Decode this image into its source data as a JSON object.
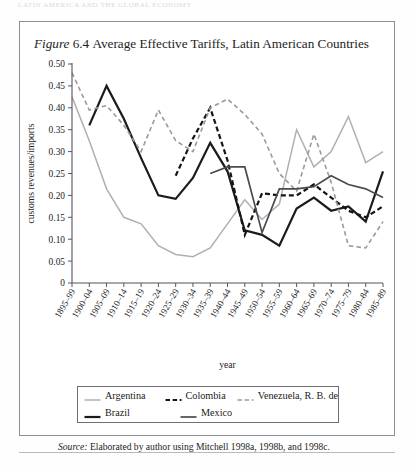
{
  "page": {
    "running_head": "LATIN AMERICA AND THE GLOBAL ECONOMY",
    "figure_title_prefix": "Figure",
    "figure_number": "6.4",
    "figure_title": "Average Effective Tariffs, Latin American Countries",
    "source_prefix": "Source:",
    "source_text": "Elaborated by author using Mitchell 1998a, 1998b, and 1998c."
  },
  "chart_data": {
    "type": "line",
    "title": "Average Effective Tariffs, Latin American Countries",
    "xlabel": "year",
    "ylabel": "customs revenues/imports",
    "ylim": [
      0,
      0.5
    ],
    "yticks": [
      "0",
      "0.05",
      "0.10",
      "0.15",
      "0.20",
      "0.25",
      "0.30",
      "0.35",
      "0.40",
      "0.45",
      "0.50"
    ],
    "ytick_values": [
      0,
      0.05,
      0.1,
      0.15,
      0.2,
      0.25,
      0.3,
      0.35,
      0.4,
      0.45,
      0.5
    ],
    "grid": false,
    "legend_position": "bottom",
    "categories": [
      "1895-99",
      "1900-04",
      "1905-09",
      "1910-14",
      "1915-19",
      "1920-24",
      "1925-29",
      "1930-34",
      "1935-39",
      "1940-44",
      "1945-49",
      "1950-54",
      "1955-59",
      "1960-64",
      "1965-69",
      "1970-74",
      "1975-79",
      "1980-84",
      "1985-89"
    ],
    "series": [
      {
        "name": "Argentina",
        "color": "#b0b0b0",
        "style": "solid",
        "width": 1.5,
        "values": [
          0.425,
          0.325,
          0.215,
          0.15,
          0.135,
          0.085,
          0.065,
          0.06,
          0.08,
          0.135,
          0.19,
          0.145,
          0.18,
          0.35,
          0.265,
          0.3,
          0.38,
          0.275,
          0.3
        ]
      },
      {
        "name": "Brazil",
        "color": "#1b1b1b",
        "style": "solid",
        "width": 2.2,
        "values": [
          null,
          0.36,
          0.45,
          0.375,
          0.285,
          0.2,
          0.192,
          0.24,
          0.32,
          0.255,
          0.12,
          0.11,
          0.085,
          0.17,
          0.195,
          0.165,
          0.175,
          0.14,
          0.255
        ]
      },
      {
        "name": "Colombia",
        "color": "#141414",
        "style": "dashed",
        "width": 2.2,
        "values": [
          null,
          null,
          null,
          null,
          null,
          null,
          0.245,
          0.33,
          0.4,
          0.28,
          0.11,
          0.205,
          0.2,
          0.2,
          0.225,
          0.195,
          0.165,
          0.15,
          0.175
        ]
      },
      {
        "name": "Venezuela, R. B. de",
        "color": "#9a9a9a",
        "style": "dashed",
        "width": 1.6,
        "values": [
          0.48,
          0.395,
          0.405,
          0.36,
          0.3,
          0.395,
          0.325,
          0.3,
          0.4,
          0.42,
          0.385,
          0.34,
          0.25,
          0.21,
          0.34,
          0.23,
          0.085,
          0.08,
          0.14
        ]
      },
      {
        "name": "Mexico",
        "color": "#4a4a52",
        "style": "solid",
        "width": 1.7,
        "values": [
          null,
          null,
          null,
          null,
          null,
          null,
          null,
          null,
          0.25,
          0.265,
          0.265,
          0.115,
          0.215,
          0.215,
          0.22,
          0.245,
          0.225,
          0.215,
          0.195
        ]
      }
    ]
  },
  "legend": {
    "row1": [
      {
        "label": "Argentina",
        "swatch": "argentina-swatch"
      },
      {
        "label": "Colombia",
        "swatch": "colombia-swatch"
      },
      {
        "label": "Venezuela, R. B. de",
        "swatch": "venezuela-swatch"
      }
    ],
    "row2": [
      {
        "label": "Brazil",
        "swatch": "brazil-swatch"
      },
      {
        "label": "Mexico",
        "swatch": "mexico-swatch"
      }
    ]
  }
}
